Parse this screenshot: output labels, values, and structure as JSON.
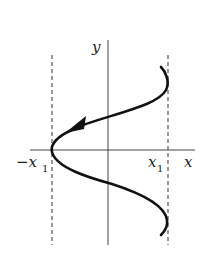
{
  "diagram": {
    "axes": {
      "x_label": "x",
      "y_label": "y",
      "x_tick_neg": "−x",
      "x_tick_neg_sub": "1",
      "x_tick_pos": "x",
      "x_tick_pos_sub": "1"
    },
    "curve": {
      "description": "S-shaped oscillation between -x1 and x1 with arrow pointing toward -x1",
      "color": "#111111"
    },
    "bounds": {
      "style": "dashed",
      "color": "#444444"
    }
  }
}
